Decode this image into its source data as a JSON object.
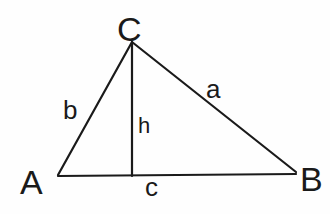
{
  "diagram": {
    "type": "triangle-with-altitude",
    "vertices": {
      "A": {
        "label": "A"
      },
      "B": {
        "label": "B"
      },
      "C": {
        "label": "C"
      }
    },
    "sides": {
      "a": {
        "label": "a",
        "from": "C",
        "to": "B"
      },
      "b": {
        "label": "b",
        "from": "A",
        "to": "C"
      },
      "c": {
        "label": "c",
        "from": "A",
        "to": "B"
      }
    },
    "altitude": {
      "label": "h",
      "from": "C",
      "to": "foot on AB"
    },
    "colors": {
      "stroke": "#1a1a1a",
      "background": "#fefefe"
    }
  }
}
